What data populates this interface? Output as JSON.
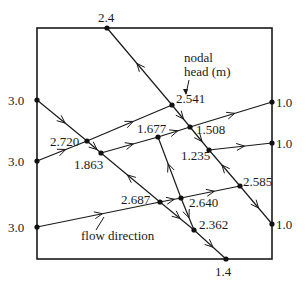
{
  "diagram": {
    "boundary": {
      "x1": 37,
      "y1": 28,
      "x2": 272,
      "y2": 259
    },
    "nodes": [
      {
        "id": "n_top",
        "label": "2.4",
        "x": 107,
        "y": 28,
        "lx": 98,
        "ly": 22
      },
      {
        "id": "n_left1",
        "label": "3.0",
        "x": 37,
        "y": 100,
        "lx": 8,
        "ly": 105
      },
      {
        "id": "n_left2",
        "label": "3.0",
        "x": 37,
        "y": 161,
        "lx": 8,
        "ly": 166
      },
      {
        "id": "n_left3",
        "label": "3.0",
        "x": 37,
        "y": 227,
        "lx": 8,
        "ly": 232
      },
      {
        "id": "n_2720",
        "label": "2.720",
        "x": 87,
        "y": 141,
        "lx": 50,
        "ly": 146
      },
      {
        "id": "n_1863",
        "label": "1.863",
        "x": 101,
        "y": 153,
        "lx": 74,
        "ly": 169
      },
      {
        "id": "n_1677",
        "label": "1.677",
        "x": 158,
        "y": 137,
        "lx": 137,
        "ly": 133
      },
      {
        "id": "n_2541",
        "label": "2.541",
        "x": 172,
        "y": 105,
        "lx": 176,
        "ly": 103
      },
      {
        "id": "n_1508",
        "label": "1.508",
        "x": 190,
        "y": 127,
        "lx": 196,
        "ly": 134
      },
      {
        "id": "n_1235",
        "label": "1.235",
        "x": 209,
        "y": 150,
        "lx": 181,
        "ly": 160
      },
      {
        "id": "n_right1",
        "label": "1.0",
        "x": 272,
        "y": 102,
        "lx": 276,
        "ly": 107
      },
      {
        "id": "n_right2",
        "label": "1.0",
        "x": 272,
        "y": 143,
        "lx": 276,
        "ly": 148
      },
      {
        "id": "n_2687",
        "label": "2.687",
        "x": 160,
        "y": 202,
        "lx": 121,
        "ly": 204
      },
      {
        "id": "n_2640",
        "label": "2.640",
        "x": 181,
        "y": 198,
        "lx": 189,
        "ly": 207
      },
      {
        "id": "n_2585",
        "label": "2.585",
        "x": 240,
        "y": 186,
        "lx": 243,
        "ly": 186
      },
      {
        "id": "n_2362",
        "label": "2.362",
        "x": 194,
        "y": 230,
        "lx": 199,
        "ly": 229
      },
      {
        "id": "n_right3",
        "label": "1.0",
        "x": 272,
        "y": 224,
        "lx": 276,
        "ly": 229
      },
      {
        "id": "n_bottom",
        "label": "1.4",
        "x": 226,
        "y": 259,
        "lx": 215,
        "ly": 276
      }
    ],
    "segments": [
      {
        "from": "n_top",
        "to": "n_2541",
        "arrow": "backward"
      },
      {
        "from": "n_2541",
        "to": "n_1508",
        "arrow": "forward"
      },
      {
        "from": "n_1508",
        "to": "n_1235",
        "arrow": "forward"
      },
      {
        "from": "n_1235",
        "to": "n_2585",
        "arrow": "backward"
      },
      {
        "from": "n_2585",
        "to": "n_right3",
        "arrow": "forward"
      },
      {
        "from": "n_left1",
        "to": "n_2720",
        "arrow": "forward"
      },
      {
        "from": "n_2720",
        "to": "n_1863",
        "arrow": "forward"
      },
      {
        "from": "n_1863",
        "to": "n_2687",
        "arrow": "backward"
      },
      {
        "from": "n_2687",
        "to": "n_2362",
        "arrow": "forward"
      },
      {
        "from": "n_2362",
        "to": "n_bottom",
        "arrow": "forward"
      },
      {
        "from": "n_left2",
        "to": "n_2720",
        "arrow": "forward"
      },
      {
        "from": "n_2720",
        "to": "n_2541",
        "arrow": "forward"
      },
      {
        "from": "n_1863",
        "to": "n_1677",
        "arrow": "forward"
      },
      {
        "from": "n_1677",
        "to": "n_1508",
        "arrow": "forward"
      },
      {
        "from": "n_1508",
        "to": "n_right1",
        "arrow": "forward"
      },
      {
        "from": "n_1235",
        "to": "n_right2",
        "arrow": "forward"
      },
      {
        "from": "n_left3",
        "to": "n_2687",
        "arrow": "forward"
      },
      {
        "from": "n_2687",
        "to": "n_2640",
        "arrow": "forward"
      },
      {
        "from": "n_2640",
        "to": "n_2585",
        "arrow": "forward"
      },
      {
        "from": "n_1677",
        "to": "n_2640",
        "arrow": "backward"
      },
      {
        "from": "n_2640",
        "to": "n_2362",
        "arrow": "forward"
      }
    ],
    "annotations": {
      "nodal_head_line1": "nodal",
      "nodal_head_line2": "head  (m)",
      "flow_direction": "flow direction"
    }
  }
}
